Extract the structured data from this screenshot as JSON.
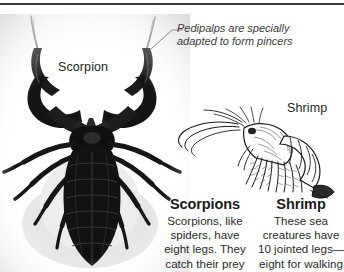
{
  "page": {
    "background_color": "#ffffff",
    "rule_color": "#3a3a3a"
  },
  "figures": {
    "scorpion": {
      "label": "Scorpion",
      "icon": "scorpion-photograph",
      "description": "Black-and-white photograph of a scorpion viewed from above with large raised pedipalp pincers"
    },
    "shrimp": {
      "label": "Shrimp",
      "icon": "shrimp-line-illustration",
      "description": "Black ink line drawing of a shrimp in profile facing left with long antennae"
    }
  },
  "callout": {
    "icon": "leader-line",
    "line1": "Pedipalps are specially",
    "line2": "adapted to form pincers",
    "color": "#3c3c3c"
  },
  "captions": [
    {
      "id": "scorpions",
      "heading": "Scorpions",
      "lines": [
        "Scorpions, like",
        "spiders, have",
        "eight legs. They",
        "catch their prey"
      ]
    },
    {
      "id": "shrimp",
      "heading": "Shrimp",
      "lines": [
        "These sea",
        "creatures have",
        "10 jointed legs—",
        "eight for walking"
      ]
    }
  ]
}
